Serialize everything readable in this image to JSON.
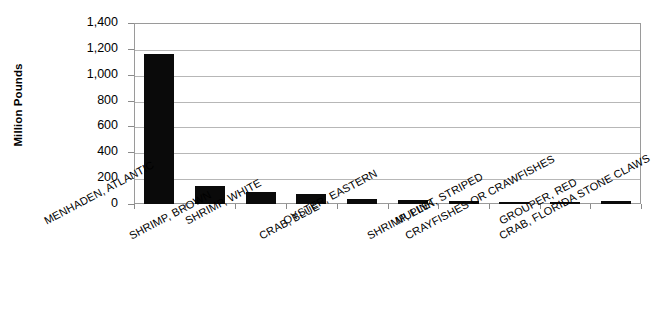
{
  "chart_data": {
    "type": "bar",
    "title": "",
    "xlabel": "",
    "ylabel": "Million Pounds",
    "ylim": [
      0,
      1400
    ],
    "ytick_labels": [
      "1,400",
      "1,200",
      "1,000",
      "800",
      "600",
      "400",
      "200",
      "0"
    ],
    "ytick_values": [
      1400,
      1200,
      1000,
      800,
      600,
      400,
      200,
      0
    ],
    "grid": true,
    "legend": "none",
    "bar_color": "#0a0a0a",
    "categories": [
      "MENHADEN, ATLANTIC",
      "SHRIMP, BROWN",
      "SHRIMP, WHITE",
      "CRAB, BLUE",
      "OYSTER, EASTERN",
      "SHRIMP, PINK",
      "MULLET, STRIPED",
      "CRAYFISHES OR CRAWFISHES",
      "GROUPER, RED",
      "CRAB, FLORIDA STONE CLAWS"
    ],
    "values": [
      1160,
      140,
      93,
      75,
      35,
      28,
      20,
      18,
      16,
      20
    ]
  },
  "axis": {
    "y_title": "Million Pounds"
  }
}
